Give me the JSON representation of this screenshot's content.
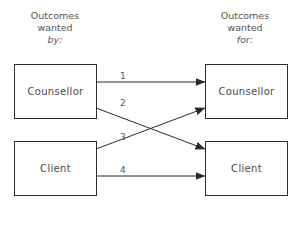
{
  "diagram": {
    "left_column": {
      "header": {
        "line1": "Outcomes",
        "line2": "wanted",
        "line3": "by:"
      },
      "boxes": [
        {
          "label": "Counsellor"
        },
        {
          "label": "Client"
        }
      ]
    },
    "right_column": {
      "header": {
        "line1": "Outcomes",
        "line2": "wanted",
        "line3": "for:"
      },
      "boxes": [
        {
          "label": "Counsellor"
        },
        {
          "label": "Client"
        }
      ]
    },
    "arrows": [
      {
        "label": "1",
        "from": "Counsellor (by)",
        "to": "Counsellor (for)"
      },
      {
        "label": "2",
        "from": "Counsellor (by)",
        "to": "Client (for)"
      },
      {
        "label": "3",
        "from": "Client (by)",
        "to": "Counsellor (for)"
      },
      {
        "label": "4",
        "from": "Client (by)",
        "to": "Client (for)"
      }
    ],
    "colors": {
      "stroke": "#2b2b2b",
      "text": "#4a4a4a"
    }
  }
}
